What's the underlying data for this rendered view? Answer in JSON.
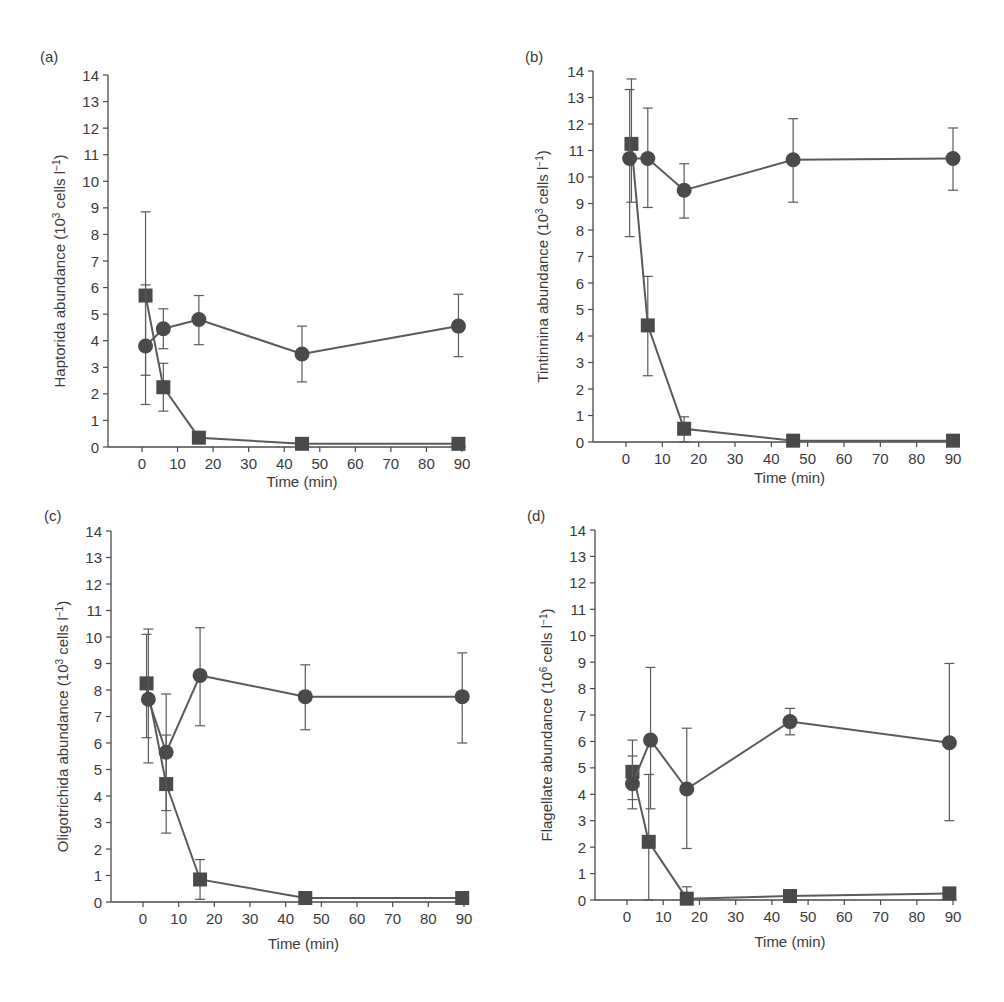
{
  "figure": {
    "colors": {
      "axis": "#4a4a4a",
      "line": "#5a5a5a",
      "marker": "#4a4a4a",
      "text": "#3a3a3a",
      "background": "#ffffff"
    }
  },
  "chart_data": [
    {
      "panel_label": "(a)",
      "type": "line",
      "title": "",
      "xlabel": "Time (min)",
      "ylabel": "Haptorida abundance (10^3 cells l^-1)",
      "ylabel_parts": {
        "base": "Haptorida abundance (10",
        "exp1": "3",
        "mid": " cells l",
        "exp2": "−1",
        "end": ")"
      },
      "xlim": [
        -8,
        91
      ],
      "ylim": [
        0,
        14
      ],
      "xticks": [
        0,
        10,
        20,
        30,
        40,
        50,
        60,
        70,
        80,
        90
      ],
      "yticks": [
        0,
        1,
        2,
        3,
        4,
        5,
        6,
        7,
        8,
        9,
        10,
        11,
        12,
        13,
        14
      ],
      "grid": false,
      "legend": "none",
      "series": [
        {
          "name": "circle",
          "marker": "circle",
          "x": [
            1,
            6,
            16,
            45,
            89
          ],
          "values": [
            3.8,
            4.45,
            4.8,
            3.5,
            4.55
          ],
          "err_low": [
            1.6,
            3.7,
            3.85,
            2.45,
            3.4
          ],
          "err_high": [
            6.1,
            5.2,
            5.7,
            4.55,
            5.75
          ]
        },
        {
          "name": "square",
          "marker": "square",
          "x": [
            1,
            6,
            16,
            45,
            89
          ],
          "values": [
            5.7,
            2.25,
            0.35,
            0.12,
            0.12
          ],
          "err_low": [
            2.7,
            1.35,
            null,
            null,
            null
          ],
          "err_high": [
            8.85,
            3.15,
            null,
            null,
            null
          ]
        }
      ]
    },
    {
      "panel_label": "(b)",
      "type": "line",
      "title": "",
      "xlabel": "Time (min)",
      "ylabel": "Tintinnina abundance (10^3 cells l^-1)",
      "ylabel_parts": {
        "base": "Tintinnina abundance (10",
        "exp1": "3",
        "mid": " cells l",
        "exp2": "−1",
        "end": ")"
      },
      "xlim": [
        -8,
        91
      ],
      "ylim": [
        0,
        14
      ],
      "xticks": [
        0,
        10,
        20,
        30,
        40,
        50,
        60,
        70,
        80,
        90
      ],
      "yticks": [
        0,
        1,
        2,
        3,
        4,
        5,
        6,
        7,
        8,
        9,
        10,
        11,
        12,
        13,
        14
      ],
      "grid": false,
      "legend": "none",
      "series": [
        {
          "name": "circle",
          "marker": "circle",
          "x": [
            1,
            6,
            16,
            46,
            90
          ],
          "values": [
            10.7,
            10.7,
            9.5,
            10.65,
            10.7
          ],
          "err_low": [
            7.75,
            8.85,
            8.45,
            9.05,
            9.5
          ],
          "err_high": [
            13.3,
            12.6,
            10.5,
            12.2,
            11.85
          ]
        },
        {
          "name": "square",
          "marker": "square",
          "x": [
            1.5,
            6,
            16,
            46,
            90
          ],
          "values": [
            11.25,
            4.4,
            0.5,
            0.05,
            0.05
          ],
          "err_low": [
            9.05,
            2.5,
            0.0,
            null,
            null
          ],
          "err_high": [
            13.7,
            6.25,
            0.95,
            null,
            null
          ]
        }
      ]
    },
    {
      "panel_label": "(c)",
      "type": "line",
      "title": "",
      "xlabel": "Time (min)",
      "ylabel": "Oligotrichida abundance (10^3 cells l^-1)",
      "ylabel_parts": {
        "base": "Oligotrichida abundance (10",
        "exp1": "3",
        "mid": " cells l",
        "exp2": "−1",
        "end": ")"
      },
      "xlim": [
        -8,
        91
      ],
      "ylim": [
        0,
        14
      ],
      "xticks": [
        0,
        10,
        20,
        30,
        40,
        50,
        60,
        70,
        80,
        90
      ],
      "yticks": [
        0,
        1,
        2,
        3,
        4,
        5,
        6,
        7,
        8,
        9,
        10,
        11,
        12,
        13,
        14
      ],
      "grid": false,
      "legend": "none",
      "series": [
        {
          "name": "circle",
          "marker": "circle",
          "x": [
            1.5,
            6.5,
            16,
            45.5,
            89.5
          ],
          "values": [
            7.65,
            5.65,
            8.55,
            7.75,
            7.75
          ],
          "err_low": [
            5.25,
            3.45,
            6.65,
            6.5,
            6.0
          ],
          "err_high": [
            10.3,
            7.85,
            10.35,
            8.95,
            9.4
          ]
        },
        {
          "name": "square",
          "marker": "square",
          "x": [
            1,
            6.5,
            16,
            45.5,
            89.5
          ],
          "values": [
            8.25,
            4.45,
            0.85,
            0.15,
            0.15
          ],
          "err_low": [
            6.2,
            2.6,
            0.1,
            null,
            null
          ],
          "err_high": [
            10.1,
            6.3,
            1.6,
            null,
            null
          ]
        }
      ]
    },
    {
      "panel_label": "(d)",
      "type": "line",
      "title": "",
      "xlabel": "Time (min)",
      "ylabel": "Flagellate abundance (10^6 cells l^-1)",
      "ylabel_parts": {
        "base": "Flagellate abundance (10",
        "exp1": "6",
        "mid": " cells l",
        "exp2": "−1",
        "end": ")"
      },
      "xlim": [
        -8,
        91
      ],
      "ylim": [
        0,
        14
      ],
      "xticks": [
        0,
        10,
        20,
        30,
        40,
        50,
        60,
        70,
        80,
        90
      ],
      "yticks": [
        0,
        1,
        2,
        3,
        4,
        5,
        6,
        7,
        8,
        9,
        10,
        11,
        12,
        13,
        14
      ],
      "grid": false,
      "legend": "none",
      "series": [
        {
          "name": "circle",
          "marker": "circle",
          "x": [
            1.5,
            6.5,
            16.5,
            45,
            89
          ],
          "values": [
            4.4,
            6.05,
            4.2,
            6.75,
            5.95
          ],
          "err_low": [
            3.45,
            3.45,
            1.95,
            6.25,
            3.0
          ],
          "err_high": [
            5.45,
            8.8,
            6.5,
            7.25,
            8.95
          ]
        },
        {
          "name": "square",
          "marker": "square",
          "x": [
            1.5,
            6,
            16.5,
            45,
            89
          ],
          "values": [
            4.85,
            2.2,
            0.05,
            0.15,
            0.25
          ],
          "err_low": [
            3.8,
            0.0,
            0.0,
            null,
            null
          ],
          "err_high": [
            6.05,
            4.75,
            0.5,
            null,
            null
          ]
        }
      ]
    }
  ],
  "layout": {
    "panels": [
      {
        "axis_x": 108,
        "y0": 447,
        "y14": 75,
        "x0": 142,
        "x90": 462,
        "label_x": 40,
        "label_y": 62,
        "ylabel_cx": 60,
        "xlabel_y": 487
      },
      {
        "axis_x": 593,
        "y0": 442,
        "y14": 71,
        "x0": 626,
        "x90": 953,
        "label_x": 525,
        "label_y": 62,
        "ylabel_cx": 543,
        "xlabel_y": 483
      },
      {
        "axis_x": 111,
        "y0": 902,
        "y14": 531,
        "x0": 143,
        "x90": 464,
        "label_x": 44,
        "label_y": 521,
        "ylabel_cx": 63,
        "xlabel_y": 949
      },
      {
        "axis_x": 595,
        "y0": 900,
        "y14": 530,
        "x0": 627,
        "x90": 953,
        "label_x": 527,
        "label_y": 521,
        "ylabel_cx": 547,
        "xlabel_y": 947
      }
    ]
  }
}
